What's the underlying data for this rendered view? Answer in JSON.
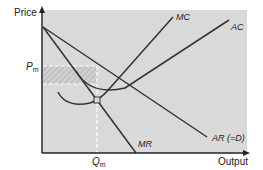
{
  "diagram": {
    "type": "monopoly-profit-maximisation",
    "axes": {
      "y_label": "Price",
      "x_label": "Output"
    },
    "curves": {
      "mc_label": "MC",
      "ac_label": "AC",
      "mr_label": "MR",
      "ar_label": "AR (=D)"
    },
    "markers": {
      "price_label_main": "P",
      "price_label_sub": "m",
      "quantity_label_main": "Q",
      "quantity_label_sub": "m"
    },
    "colors": {
      "background": "#d9d9d9",
      "line": "#333333",
      "dash": "#ffffff",
      "hatch": "#bcbcbc"
    }
  }
}
